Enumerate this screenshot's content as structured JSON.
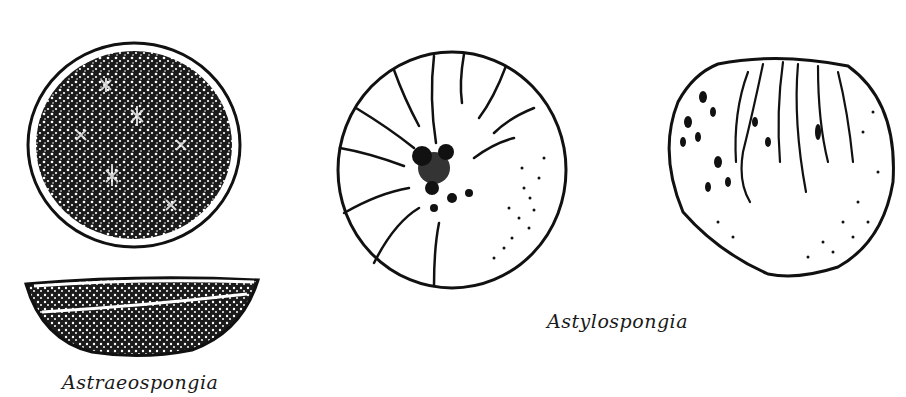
{
  "figures": [
    {
      "id": "astraeospongia",
      "label": "Astraeospongia",
      "views": [
        "top-view-disc",
        "side-view-bowl"
      ]
    },
    {
      "id": "astylospongia",
      "label": "Astylospongia",
      "views": [
        "top-view-radial",
        "side-view-globe"
      ]
    }
  ],
  "colors": {
    "ink": "#111111",
    "paper": "#ffffff"
  }
}
